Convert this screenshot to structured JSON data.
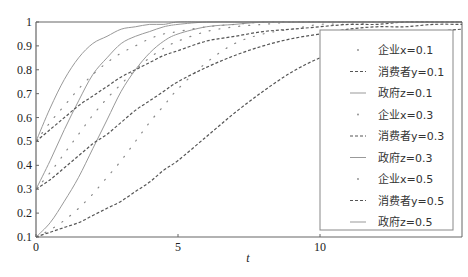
{
  "chart_data": {
    "type": "line",
    "title": "",
    "xlabel": "t",
    "ylabel": "",
    "xlim": [
      0,
      15
    ],
    "ylim": [
      0.1,
      1
    ],
    "xticks": [
      "0",
      "5",
      "10"
    ],
    "yticks": [
      "0.1",
      "0.2",
      "0.3",
      "0.4",
      "0.5",
      "0.6",
      "0.7",
      "0.8",
      "0.9",
      "1"
    ],
    "grid": false,
    "legend_position": "right",
    "x": [
      0,
      0.5,
      1,
      1.5,
      2,
      2.5,
      3,
      3.5,
      4,
      4.5,
      5,
      6,
      7,
      8,
      9,
      10,
      11,
      12,
      13,
      14,
      15
    ],
    "series": [
      {
        "name": "企业x=0.1",
        "style": "dotted",
        "values": [
          0.1,
          0.13,
          0.17,
          0.22,
          0.28,
          0.35,
          0.42,
          0.5,
          0.58,
          0.65,
          0.72,
          0.83,
          0.91,
          0.95,
          0.97,
          0.99,
          0.99,
          1.0,
          1.0,
          1.0,
          1.0
        ]
      },
      {
        "name": "消费者y=0.1",
        "style": "dashed",
        "values": [
          0.1,
          0.12,
          0.14,
          0.16,
          0.19,
          0.22,
          0.25,
          0.29,
          0.33,
          0.38,
          0.42,
          0.52,
          0.62,
          0.71,
          0.79,
          0.85,
          0.89,
          0.93,
          0.95,
          0.96,
          0.97
        ]
      },
      {
        "name": "政府z=0.1",
        "style": "solid",
        "values": [
          0.1,
          0.16,
          0.25,
          0.35,
          0.47,
          0.59,
          0.71,
          0.8,
          0.87,
          0.92,
          0.95,
          0.98,
          0.99,
          1.0,
          1.0,
          1.0,
          1.0,
          1.0,
          1.0,
          1.0,
          1.0
        ]
      },
      {
        "name": "企业x=0.3",
        "style": "dotted",
        "values": [
          0.3,
          0.37,
          0.45,
          0.53,
          0.61,
          0.68,
          0.74,
          0.8,
          0.85,
          0.89,
          0.92,
          0.96,
          0.98,
          0.99,
          1.0,
          1.0,
          1.0,
          1.0,
          1.0,
          1.0,
          1.0
        ]
      },
      {
        "name": "消费者y=0.3",
        "style": "dashed",
        "values": [
          0.3,
          0.34,
          0.39,
          0.44,
          0.49,
          0.53,
          0.58,
          0.63,
          0.67,
          0.71,
          0.75,
          0.81,
          0.86,
          0.9,
          0.93,
          0.95,
          0.97,
          0.98,
          0.98,
          0.99,
          0.99
        ]
      },
      {
        "name": "政府z=0.3",
        "style": "solid",
        "values": [
          0.3,
          0.42,
          0.55,
          0.67,
          0.78,
          0.85,
          0.91,
          0.94,
          0.96,
          0.98,
          0.99,
          1.0,
          1.0,
          1.0,
          1.0,
          1.0,
          1.0,
          1.0,
          1.0,
          1.0,
          1.0
        ]
      },
      {
        "name": "企业x=0.5",
        "style": "dotted",
        "values": [
          0.5,
          0.58,
          0.65,
          0.72,
          0.78,
          0.83,
          0.87,
          0.9,
          0.93,
          0.95,
          0.96,
          0.98,
          0.99,
          1.0,
          1.0,
          1.0,
          1.0,
          1.0,
          1.0,
          1.0,
          1.0
        ]
      },
      {
        "name": "消费者y=0.5",
        "style": "dashed",
        "values": [
          0.5,
          0.55,
          0.6,
          0.65,
          0.69,
          0.73,
          0.77,
          0.8,
          0.83,
          0.86,
          0.88,
          0.92,
          0.94,
          0.96,
          0.97,
          0.98,
          0.99,
          0.99,
          1.0,
          1.0,
          1.0
        ]
      },
      {
        "name": "政府z=0.5",
        "style": "solid",
        "values": [
          0.5,
          0.64,
          0.76,
          0.85,
          0.91,
          0.94,
          0.97,
          0.98,
          0.99,
          0.99,
          1.0,
          1.0,
          1.0,
          1.0,
          1.0,
          1.0,
          1.0,
          1.0,
          1.0,
          1.0,
          1.0
        ]
      }
    ]
  },
  "legend": {
    "items": [
      {
        "label": "企业x=0.1",
        "style": "dotted"
      },
      {
        "label": "消费者y=0.1",
        "style": "dashed"
      },
      {
        "label": "政府z=0.1",
        "style": "solid"
      },
      {
        "label": "企业x=0.3",
        "style": "dotted"
      },
      {
        "label": "消费者y=0.3",
        "style": "dashed"
      },
      {
        "label": "政府z=0.3",
        "style": "solid"
      },
      {
        "label": "企业x=0.5",
        "style": "dotted"
      },
      {
        "label": "消费者y=0.5",
        "style": "dashed"
      },
      {
        "label": "政府z=0.5",
        "style": "solid"
      }
    ]
  },
  "colors": {
    "solid": "#999999",
    "dashed": "#555555",
    "dotted": "#888888",
    "axis": "#666666"
  }
}
